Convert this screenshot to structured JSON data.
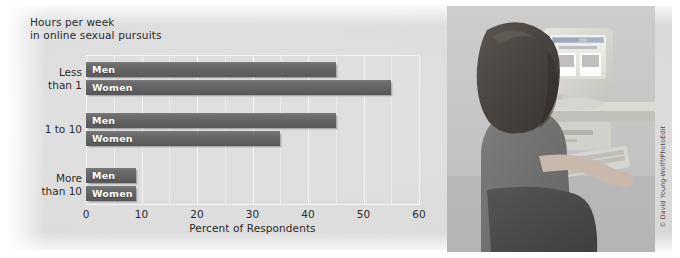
{
  "chart_data": {
    "type": "bar",
    "orientation": "horizontal",
    "title": "Hours per week\nin online sexual pursuits",
    "xlabel": "Percent of Respondents",
    "ylabel": "",
    "xlim": [
      0,
      60
    ],
    "xticks": [
      0,
      10,
      20,
      30,
      40,
      50,
      60
    ],
    "grid": true,
    "legend": "inside-bar-labels",
    "categories": [
      "Less\nthan 1",
      "1 to 10",
      "More\nthan 10"
    ],
    "series": [
      {
        "name": "Men",
        "values": [
          45,
          45,
          9
        ]
      },
      {
        "name": "Women",
        "values": [
          55,
          35,
          9
        ]
      }
    ],
    "groups": [
      {
        "category": "Less\nthan 1",
        "bars": [
          {
            "label": "Men",
            "value": 45
          },
          {
            "label": "Women",
            "value": 55
          }
        ]
      },
      {
        "category": "1 to 10",
        "bars": [
          {
            "label": "Men",
            "value": 45
          },
          {
            "label": "Women",
            "value": 35
          }
        ]
      },
      {
        "category": "More\nthan 10",
        "bars": [
          {
            "label": "Men",
            "value": 9
          },
          {
            "label": "Women",
            "value": 9
          }
        ]
      }
    ],
    "colors": {
      "bar": "#636363",
      "plot_background": "#dedede",
      "gridline": "#f4f4f4",
      "text": "#2b2b2b",
      "bar_label_text": "#ffffff"
    }
  },
  "photo": {
    "alt": "Woman seated at a desk using a desktop computer, viewed from behind",
    "credit": "© David Young-Wolff/PhotoEdit"
  }
}
